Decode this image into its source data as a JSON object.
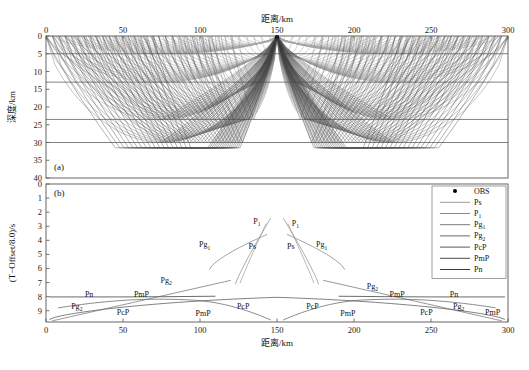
{
  "figure": {
    "top_axis_title": "距离/km",
    "bottom_axis_title": "距离/km",
    "panel_a_ylabel": "深度/km",
    "panel_b_ylabel": "(T−Offset/8.0)/s",
    "panel_a_tag": "(a)",
    "panel_b_tag": "(b)",
    "background": "#ffffff",
    "axis_color": "#555555"
  },
  "chart_data": [
    {
      "type": "line",
      "name": "panel-a-raypaths",
      "title": "(a)",
      "xlabel": "距离/km",
      "ylabel": "深度/km",
      "xlim": [
        0,
        300
      ],
      "ylim": [
        0,
        40
      ],
      "y_inverted": true,
      "xticks": [
        0,
        50,
        100,
        150,
        200,
        250,
        300
      ],
      "yticks": [
        0,
        5,
        10,
        15,
        20,
        25,
        30,
        35,
        40
      ],
      "grid": false,
      "x_axis_position": "top",
      "annotations": [
        {
          "label": "(a)",
          "x": 8,
          "y": 37
        }
      ],
      "source": {
        "name": "OBS",
        "x": 150,
        "depth": 0,
        "marker": "filled-circle",
        "color": "#000000"
      },
      "layer_interfaces": [
        {
          "name": "sediment-base",
          "depth": 5.0
        },
        {
          "name": "upper-crust-base",
          "depth": 13.0
        },
        {
          "name": "middle-crust-base",
          "depth": 23.5
        },
        {
          "name": "moho",
          "depth": 30.0
        }
      ],
      "ray_families": [
        {
          "name": "Ps",
          "color": "#9a9a9a",
          "turning_depth_range": [
            1.5,
            5.0
          ],
          "count": 26,
          "offset_range": [
            5,
            145
          ]
        },
        {
          "name": "P1",
          "color": "#8a8a8a",
          "turning_depth_range": [
            5.0,
            13.0
          ],
          "count": 30,
          "offset_range": [
            10,
            150
          ]
        },
        {
          "name": "Pg1",
          "color": "#7a7a7a",
          "turning_depth_range": [
            13.0,
            23.5
          ],
          "count": 30,
          "offset_range": [
            25,
            150
          ]
        },
        {
          "name": "Pg2",
          "color": "#6a6a6a",
          "turning_depth_range": [
            23.5,
            30.0
          ],
          "count": 28,
          "offset_range": [
            40,
            150
          ]
        },
        {
          "name": "PcP",
          "color": "#5a5a5a",
          "reflector_depth": 23.5,
          "count": 20,
          "offset_range": [
            30,
            150
          ]
        },
        {
          "name": "PmP",
          "color": "#4a4a4a",
          "reflector_depth": 30.0,
          "count": 24,
          "offset_range": [
            45,
            150
          ]
        },
        {
          "name": "Pn",
          "color": "#3a3a3a",
          "refractor_depth": 31.5,
          "count": 18,
          "offset_range": [
            80,
            150
          ]
        }
      ]
    },
    {
      "type": "line",
      "name": "panel-b-traveltime",
      "title": "(b)",
      "xlabel": "距离/km",
      "ylabel": "(T−Offset/8.0)/s",
      "xlim": [
        0,
        300
      ],
      "ylim": [
        0,
        9.8
      ],
      "y_inverted": true,
      "xticks": [
        0,
        50,
        100,
        150,
        200,
        250,
        300
      ],
      "yticks": [
        0,
        1,
        2,
        3,
        4,
        5,
        6,
        7,
        8,
        9
      ],
      "grid": false,
      "x_axis_position": "bottom",
      "curve_labels": [
        {
          "text": "Pn",
          "x": 28,
          "y": 8.05,
          "side": "left"
        },
        {
          "text": "PmP",
          "x": 62,
          "y": 8.05,
          "side": "left"
        },
        {
          "text": "Pg",
          "sub": "2",
          "x": 78,
          "y": 7.0,
          "side": "left"
        },
        {
          "text": "Pg",
          "sub": "2",
          "x": 20,
          "y": 8.85,
          "side": "left"
        },
        {
          "text": "PcP",
          "x": 50,
          "y": 9.3,
          "side": "left"
        },
        {
          "text": "PmP",
          "x": 102,
          "y": 9.35,
          "side": "left"
        },
        {
          "text": "PcP",
          "x": 128,
          "y": 8.85,
          "side": "left"
        },
        {
          "text": "Pg",
          "sub": "1",
          "x": 103,
          "y": 4.5,
          "side": "left"
        },
        {
          "text": "Ps",
          "x": 134,
          "y": 4.6,
          "side": "left"
        },
        {
          "text": "P",
          "sub": "1",
          "x": 137,
          "y": 2.85,
          "side": "left"
        },
        {
          "text": "P",
          "sub": "1",
          "x": 162,
          "y": 3.0,
          "side": "right"
        },
        {
          "text": "Ps",
          "x": 159,
          "y": 4.6,
          "side": "right"
        },
        {
          "text": "Pg",
          "sub": "1",
          "x": 179,
          "y": 4.5,
          "side": "right"
        },
        {
          "text": "PcP",
          "x": 173,
          "y": 8.85,
          "side": "right"
        },
        {
          "text": "PmP",
          "x": 196,
          "y": 9.35,
          "side": "right"
        },
        {
          "text": "Pg",
          "sub": "2",
          "x": 212,
          "y": 7.45,
          "side": "right"
        },
        {
          "text": "PmP",
          "x": 228,
          "y": 8.05,
          "side": "right"
        },
        {
          "text": "Pn",
          "x": 265,
          "y": 8.05,
          "side": "right"
        },
        {
          "text": "PcP",
          "x": 247,
          "y": 9.3,
          "side": "right"
        },
        {
          "text": "Pg",
          "sub": "2",
          "x": 268,
          "y": 8.85,
          "side": "right"
        },
        {
          "text": "PmP",
          "x": 290,
          "y": 9.3,
          "side": "right"
        }
      ],
      "series": [
        {
          "name": "Pn",
          "color": "#3a3a3a",
          "description": "near-flat reduced branch at ~8.0 s"
        },
        {
          "name": "PmP",
          "color": "#4a4a4a",
          "description": "Moho reflection arcing from 9.6 to 8.0 s"
        },
        {
          "name": "PcP",
          "color": "#5a5a5a",
          "description": "mid-crust reflection arc peaking near 8.6 s"
        },
        {
          "name": "Pg2",
          "color": "#6a6a6a",
          "description": "lower-crust refraction sloping 9.7 to 6.8 s"
        },
        {
          "name": "Pg1",
          "color": "#7a7a7a",
          "description": "upper-crust refraction 6.1 to 3.6 s"
        },
        {
          "name": "P1",
          "color": "#8a8a8a",
          "description": "steep branch from 7.1 to 2.4 s"
        },
        {
          "name": "Ps",
          "color": "#9a9a9a",
          "description": "sediment branch steeply rising near source"
        }
      ]
    }
  ],
  "legend": {
    "position": "top-right-panel-b",
    "items": [
      {
        "label": "OBS",
        "marker": "filled-circle",
        "color": "#000000"
      },
      {
        "label": "Ps",
        "sub": "",
        "marker": "line",
        "color": "#9a9a9a"
      },
      {
        "label": "P",
        "sub": "1",
        "marker": "line",
        "color": "#8a8a8a"
      },
      {
        "label": "Pg",
        "sub": "1",
        "marker": "line",
        "color": "#7a7a7a"
      },
      {
        "label": "Pg",
        "sub": "2",
        "marker": "line",
        "color": "#6a6a6a"
      },
      {
        "label": "PcP",
        "sub": "",
        "marker": "line",
        "color": "#5a5a5a"
      },
      {
        "label": "PmP",
        "sub": "",
        "marker": "line",
        "color": "#4a4a4a"
      },
      {
        "label": "Pn",
        "sub": "",
        "marker": "line",
        "color": "#3a3a3a"
      }
    ]
  },
  "axes": {
    "x_ticks": [
      "0",
      "50",
      "100",
      "150",
      "200",
      "250",
      "300"
    ],
    "panel_a_y_ticks": [
      "0",
      "5",
      "10",
      "15",
      "20",
      "25",
      "30",
      "35",
      "40"
    ],
    "panel_b_y_ticks": [
      "0",
      "1",
      "2",
      "3",
      "4",
      "5",
      "6",
      "7",
      "8",
      "9"
    ]
  }
}
